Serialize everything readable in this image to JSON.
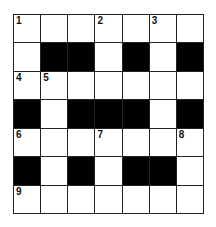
{
  "puzzle": {
    "rows": 7,
    "cols": 7,
    "grid": [
      [
        "1",
        "",
        "",
        "2",
        "",
        "3",
        ""
      ],
      [
        "",
        "#",
        "#",
        "",
        "#",
        "",
        "#"
      ],
      [
        "4",
        "5",
        "",
        "",
        "",
        "",
        ""
      ],
      [
        "#",
        "",
        "#",
        "#",
        "#",
        "",
        "#"
      ],
      [
        "6",
        "",
        "",
        "7",
        "",
        "",
        "8"
      ],
      [
        "#",
        "",
        "#",
        "",
        "#",
        "#",
        ""
      ],
      [
        "9",
        "",
        "",
        "",
        "",
        "",
        ""
      ]
    ],
    "colors": {
      "black": "#000000",
      "white": "#ffffff",
      "line": "#222222"
    }
  }
}
